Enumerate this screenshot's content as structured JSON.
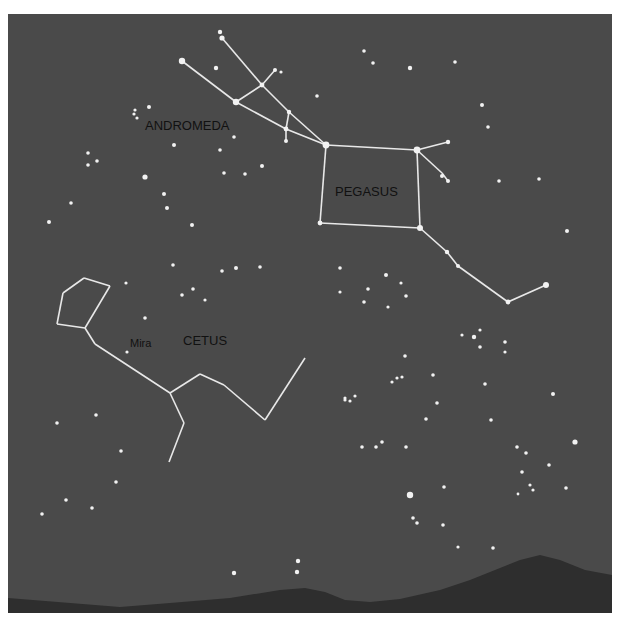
{
  "colors": {
    "page": "#ffffff",
    "sky": "#4a4a4a",
    "mountains": "#2e2e2e",
    "stars": "#f2f2f2",
    "lines": "#e8e8e8",
    "labels": "#141414"
  },
  "labels": [
    {
      "id": "andromeda",
      "text": "ANDROMEDA",
      "x": 145,
      "y": 130,
      "size": 13
    },
    {
      "id": "pegasus",
      "text": "PEGASUS",
      "x": 335,
      "y": 196,
      "size": 13
    },
    {
      "id": "cetus",
      "text": "CETUS",
      "x": 183,
      "y": 345,
      "size": 13
    },
    {
      "id": "mira",
      "text": "Mira",
      "x": 130,
      "y": 347,
      "size": 11
    }
  ],
  "constellations": [
    {
      "name": "Andromeda",
      "lines": [
        [
          [
            182,
            61
          ],
          [
            236,
            102
          ]
        ],
        [
          [
            236,
            102
          ],
          [
            286,
            129
          ]
        ],
        [
          [
            286,
            129
          ],
          [
            326,
            145
          ]
        ],
        [
          [
            236,
            102
          ],
          [
            262,
            85
          ]
        ],
        [
          [
            262,
            85
          ],
          [
            275,
            70
          ]
        ],
        [
          [
            222,
            38
          ],
          [
            262,
            85
          ]
        ],
        [
          [
            262,
            85
          ],
          [
            289,
            112
          ]
        ],
        [
          [
            289,
            112
          ],
          [
            326,
            145
          ]
        ],
        [
          [
            289,
            112
          ],
          [
            286,
            129
          ]
        ],
        [
          [
            286,
            129
          ],
          [
            286,
            141
          ]
        ]
      ]
    },
    {
      "name": "Pegasus",
      "lines": [
        [
          [
            326,
            145
          ],
          [
            417,
            150
          ]
        ],
        [
          [
            417,
            150
          ],
          [
            420,
            228
          ]
        ],
        [
          [
            420,
            228
          ],
          [
            320,
            223
          ]
        ],
        [
          [
            320,
            223
          ],
          [
            326,
            145
          ]
        ],
        [
          [
            417,
            150
          ],
          [
            448,
            142
          ]
        ],
        [
          [
            417,
            150
          ],
          [
            442,
            173
          ]
        ],
        [
          [
            442,
            173
          ],
          [
            448,
            181
          ]
        ],
        [
          [
            420,
            228
          ],
          [
            447,
            252
          ]
        ],
        [
          [
            447,
            252
          ],
          [
            458,
            266
          ]
        ],
        [
          [
            458,
            266
          ],
          [
            508,
            302
          ]
        ],
        [
          [
            508,
            302
          ],
          [
            546,
            285
          ]
        ]
      ]
    },
    {
      "name": "Cetus",
      "lines": [
        [
          [
            84,
            278
          ],
          [
            110,
            286
          ]
        ],
        [
          [
            84,
            278
          ],
          [
            63,
            293
          ]
        ],
        [
          [
            63,
            293
          ],
          [
            57,
            324
          ]
        ],
        [
          [
            57,
            324
          ],
          [
            85,
            328
          ]
        ],
        [
          [
            85,
            328
          ],
          [
            110,
            286
          ]
        ],
        [
          [
            85,
            328
          ],
          [
            95,
            344
          ]
        ],
        [
          [
            95,
            344
          ],
          [
            170,
            393
          ]
        ],
        [
          [
            170,
            393
          ],
          [
            200,
            374
          ]
        ],
        [
          [
            200,
            374
          ],
          [
            224,
            385
          ]
        ],
        [
          [
            224,
            385
          ],
          [
            265,
            420
          ]
        ],
        [
          [
            265,
            420
          ],
          [
            305,
            358
          ]
        ],
        [
          [
            170,
            393
          ],
          [
            184,
            423
          ]
        ],
        [
          [
            184,
            423
          ],
          [
            169,
            462
          ]
        ]
      ]
    }
  ],
  "stars": [
    {
      "x": 220,
      "y": 32,
      "r": 2.2
    },
    {
      "x": 222,
      "y": 38,
      "r": 2.6
    },
    {
      "x": 182,
      "y": 61,
      "r": 3.2
    },
    {
      "x": 216,
      "y": 68,
      "r": 2.2
    },
    {
      "x": 236,
      "y": 102,
      "r": 3.2
    },
    {
      "x": 262,
      "y": 85,
      "r": 2.4
    },
    {
      "x": 275,
      "y": 70,
      "r": 2
    },
    {
      "x": 281,
      "y": 72,
      "r": 1.6
    },
    {
      "x": 289,
      "y": 112,
      "r": 2.2
    },
    {
      "x": 286,
      "y": 129,
      "r": 2.4
    },
    {
      "x": 286,
      "y": 141,
      "r": 2
    },
    {
      "x": 326,
      "y": 145,
      "r": 3.4
    },
    {
      "x": 417,
      "y": 150,
      "r": 3.4
    },
    {
      "x": 448,
      "y": 142,
      "r": 2.2
    },
    {
      "x": 442,
      "y": 176,
      "r": 2
    },
    {
      "x": 448,
      "y": 181,
      "r": 2
    },
    {
      "x": 320,
      "y": 223,
      "r": 2.4
    },
    {
      "x": 420,
      "y": 228,
      "r": 3
    },
    {
      "x": 447,
      "y": 252,
      "r": 2.2
    },
    {
      "x": 458,
      "y": 266,
      "r": 2
    },
    {
      "x": 508,
      "y": 302,
      "r": 2.4
    },
    {
      "x": 546,
      "y": 285,
      "r": 3
    },
    {
      "x": 135,
      "y": 110,
      "r": 1.6
    },
    {
      "x": 134,
      "y": 114,
      "r": 1.6
    },
    {
      "x": 137,
      "y": 118,
      "r": 1.6
    },
    {
      "x": 149,
      "y": 107,
      "r": 2
    },
    {
      "x": 174,
      "y": 145,
      "r": 2
    },
    {
      "x": 234,
      "y": 137,
      "r": 1.8
    },
    {
      "x": 88,
      "y": 153,
      "r": 1.8
    },
    {
      "x": 88,
      "y": 165,
      "r": 1.8
    },
    {
      "x": 97,
      "y": 161,
      "r": 1.8
    },
    {
      "x": 145,
      "y": 177,
      "r": 2.6
    },
    {
      "x": 164,
      "y": 194,
      "r": 2
    },
    {
      "x": 220,
      "y": 150,
      "r": 1.8
    },
    {
      "x": 224,
      "y": 173,
      "r": 1.8
    },
    {
      "x": 245,
      "y": 174,
      "r": 1.8
    },
    {
      "x": 262,
      "y": 166,
      "r": 2
    },
    {
      "x": 71,
      "y": 203,
      "r": 1.8
    },
    {
      "x": 49,
      "y": 222,
      "r": 2
    },
    {
      "x": 167,
      "y": 208,
      "r": 2
    },
    {
      "x": 192,
      "y": 225,
      "r": 2
    },
    {
      "x": 364,
      "y": 51,
      "r": 1.8
    },
    {
      "x": 373,
      "y": 63,
      "r": 1.8
    },
    {
      "x": 410,
      "y": 68,
      "r": 2.2
    },
    {
      "x": 455,
      "y": 62,
      "r": 1.8
    },
    {
      "x": 317,
      "y": 96,
      "r": 1.8
    },
    {
      "x": 482,
      "y": 105,
      "r": 2
    },
    {
      "x": 488,
      "y": 127,
      "r": 1.8
    },
    {
      "x": 499,
      "y": 181,
      "r": 1.8
    },
    {
      "x": 539,
      "y": 179,
      "r": 1.8
    },
    {
      "x": 567,
      "y": 231,
      "r": 2
    },
    {
      "x": 173,
      "y": 265,
      "r": 1.8
    },
    {
      "x": 222,
      "y": 271,
      "r": 1.8
    },
    {
      "x": 236,
      "y": 268,
      "r": 2
    },
    {
      "x": 260,
      "y": 267,
      "r": 1.8
    },
    {
      "x": 182,
      "y": 295,
      "r": 1.8
    },
    {
      "x": 193,
      "y": 289,
      "r": 1.8
    },
    {
      "x": 126,
      "y": 283,
      "r": 1.6
    },
    {
      "x": 145,
      "y": 318,
      "r": 1.8
    },
    {
      "x": 127,
      "y": 352,
      "r": 1.6
    },
    {
      "x": 340,
      "y": 268,
      "r": 1.8
    },
    {
      "x": 340,
      "y": 292,
      "r": 1.6
    },
    {
      "x": 368,
      "y": 289,
      "r": 1.8
    },
    {
      "x": 386,
      "y": 275,
      "r": 2
    },
    {
      "x": 401,
      "y": 283,
      "r": 1.6
    },
    {
      "x": 406,
      "y": 296,
      "r": 1.8
    },
    {
      "x": 364,
      "y": 302,
      "r": 1.8
    },
    {
      "x": 388,
      "y": 307,
      "r": 1.6
    },
    {
      "x": 462,
      "y": 335,
      "r": 1.6
    },
    {
      "x": 474,
      "y": 337,
      "r": 2.2
    },
    {
      "x": 480,
      "y": 330,
      "r": 1.6
    },
    {
      "x": 480,
      "y": 347,
      "r": 1.8
    },
    {
      "x": 505,
      "y": 342,
      "r": 1.8
    },
    {
      "x": 505,
      "y": 352,
      "r": 1.6
    },
    {
      "x": 485,
      "y": 384,
      "r": 1.8
    },
    {
      "x": 553,
      "y": 394,
      "r": 2
    },
    {
      "x": 491,
      "y": 420,
      "r": 1.8
    },
    {
      "x": 575,
      "y": 442,
      "r": 2.6
    },
    {
      "x": 517,
      "y": 447,
      "r": 1.8
    },
    {
      "x": 526,
      "y": 453,
      "r": 1.8
    },
    {
      "x": 549,
      "y": 465,
      "r": 1.8
    },
    {
      "x": 522,
      "y": 472,
      "r": 1.8
    },
    {
      "x": 566,
      "y": 488,
      "r": 1.8
    },
    {
      "x": 530,
      "y": 485,
      "r": 1.6
    },
    {
      "x": 533,
      "y": 490,
      "r": 1.6
    },
    {
      "x": 518,
      "y": 494,
      "r": 1.4
    },
    {
      "x": 405,
      "y": 356,
      "r": 1.8
    },
    {
      "x": 433,
      "y": 375,
      "r": 1.8
    },
    {
      "x": 392,
      "y": 382,
      "r": 1.6
    },
    {
      "x": 397,
      "y": 378,
      "r": 1.6
    },
    {
      "x": 402,
      "y": 377,
      "r": 1.6
    },
    {
      "x": 437,
      "y": 403,
      "r": 1.8
    },
    {
      "x": 426,
      "y": 419,
      "r": 1.8
    },
    {
      "x": 345,
      "y": 398,
      "r": 1.6
    },
    {
      "x": 350,
      "y": 401,
      "r": 1.6
    },
    {
      "x": 355,
      "y": 396,
      "r": 1.6
    },
    {
      "x": 345,
      "y": 400,
      "r": 1.6
    },
    {
      "x": 362,
      "y": 447,
      "r": 1.8
    },
    {
      "x": 376,
      "y": 447,
      "r": 1.8
    },
    {
      "x": 382,
      "y": 442,
      "r": 1.8
    },
    {
      "x": 406,
      "y": 447,
      "r": 1.8
    },
    {
      "x": 57,
      "y": 423,
      "r": 1.8
    },
    {
      "x": 96,
      "y": 415,
      "r": 1.8
    },
    {
      "x": 121,
      "y": 451,
      "r": 1.8
    },
    {
      "x": 42,
      "y": 514,
      "r": 1.8
    },
    {
      "x": 66,
      "y": 500,
      "r": 1.8
    },
    {
      "x": 92,
      "y": 508,
      "r": 1.8
    },
    {
      "x": 116,
      "y": 482,
      "r": 1.8
    },
    {
      "x": 410,
      "y": 495,
      "r": 3.2
    },
    {
      "x": 444,
      "y": 487,
      "r": 1.8
    },
    {
      "x": 413,
      "y": 518,
      "r": 1.8
    },
    {
      "x": 417,
      "y": 523,
      "r": 1.8
    },
    {
      "x": 443,
      "y": 525,
      "r": 1.8
    },
    {
      "x": 458,
      "y": 547,
      "r": 1.6
    },
    {
      "x": 493,
      "y": 548,
      "r": 1.8
    },
    {
      "x": 234,
      "y": 573,
      "r": 2.2
    },
    {
      "x": 298,
      "y": 561,
      "r": 2.2
    },
    {
      "x": 297,
      "y": 572,
      "r": 2.2
    },
    {
      "x": 205,
      "y": 300,
      "r": 1.6
    }
  ],
  "mountains": {
    "path": "M 8 613 L 8 598 L 120 607 L 170 603 L 230 598 L 280 590 L 305 588 L 325 592 L 345 600 L 370 602 L 400 599 L 440 590 L 470 580 L 500 568 L 520 560 L 540 555 L 560 560 L 585 570 L 612 575 L 612 613 Z"
  }
}
